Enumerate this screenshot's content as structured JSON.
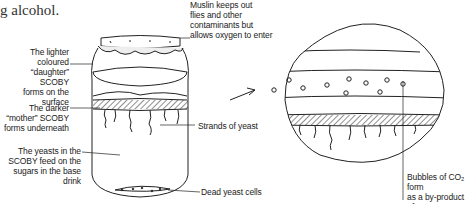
{
  "intro_text": "g alcohol.",
  "labels": {
    "muslin": [
      "Muslin keeps out",
      "flies and other",
      "contaminants but",
      "allows oxygen to enter"
    ],
    "daughter": [
      "The lighter coloured",
      "“daughter” SCOBY",
      "forms on the surface"
    ],
    "mother": [
      "The darker",
      "“mother” SCOBY",
      "forms underneath"
    ],
    "strands": [
      "Strands of yeast"
    ],
    "yeasts_feed": [
      "The yeasts in the",
      "SCOBY feed on the",
      "sugars in the base drink"
    ],
    "dead_yeast": [
      "Dead yeast cells"
    ],
    "bubbles": [
      "Bubbles of CO₂ form",
      "as a by-product of",
      "fermentation"
    ]
  },
  "colors": {
    "ink": "#222222",
    "background": "#ffffff"
  }
}
